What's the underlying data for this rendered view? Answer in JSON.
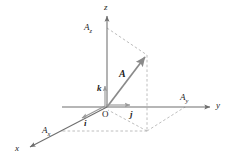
{
  "figure": {
    "background_color": "#ffffff",
    "line_color": "#8c8c8c",
    "dash_color": "#a8a8a8",
    "label_color": "#1c1c1c",
    "width": 229,
    "height": 163
  },
  "axes": {
    "z": {
      "label": "z",
      "direction": "up"
    },
    "y": {
      "label": "y",
      "direction": "right"
    },
    "x": {
      "label": "x",
      "direction": "down-left"
    }
  },
  "origin": {
    "label": "O"
  },
  "vector": {
    "label": "A",
    "description": "main position vector"
  },
  "components": {
    "z": {
      "base": "A",
      "sub": "z"
    },
    "y": {
      "base": "A",
      "sub": "y"
    },
    "x": {
      "base": "A",
      "sub": "x"
    }
  },
  "unit_vectors": {
    "i": {
      "label": "i",
      "along": "x"
    },
    "j": {
      "label": "j",
      "along": "y"
    },
    "k": {
      "label": "k",
      "along": "z"
    }
  }
}
